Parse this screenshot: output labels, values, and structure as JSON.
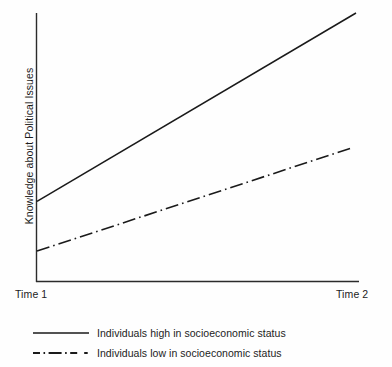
{
  "chart_data": {
    "type": "line",
    "title": "",
    "subtitle": "",
    "xlabel": "",
    "ylabel": "Knowledge about Political Issues",
    "x": [
      "Time 1",
      "Time 2"
    ],
    "categories": [
      "Time 1",
      "Time 2"
    ],
    "xticklabels": [
      "Time 1",
      "Time 2"
    ],
    "yticklabels": [],
    "xlim": [
      0,
      1
    ],
    "ylim": [
      0,
      1
    ],
    "grid": false,
    "legend_position": "below-axes-left",
    "series": [
      {
        "name": "Individuals high in socioeconomic status",
        "linestyle": "solid",
        "color": "#1a1a1a",
        "values": [
          0.3,
          1.0
        ],
        "points": [
          {
            "x": "Time 1",
            "y": 0.3
          },
          {
            "x": "Time 2",
            "y": 1.0
          }
        ]
      },
      {
        "name": "Individuals low in socioeconomic status",
        "linestyle": "dash-dot",
        "color": "#1a1a1a",
        "values": [
          0.115,
          0.5
        ],
        "points": [
          {
            "x": "Time 1",
            "y": 0.115
          },
          {
            "x": "Time 2",
            "y": 0.5
          }
        ]
      }
    ],
    "annotations": []
  },
  "axes": {
    "y_axis_label": "Knowledge about Political Issues",
    "x_tick_left": "Time 1",
    "x_tick_right": "Time 2",
    "axis_color": "#2b2b2b"
  },
  "legend": {
    "items": [
      {
        "label": "Individuals high in socioeconomic status",
        "style": "solid",
        "swatch_name": "legend-swatch-solid"
      },
      {
        "label": "Individuals low in socioeconomic status",
        "style": "dash-dot",
        "swatch_name": "legend-swatch-dashdot"
      }
    ]
  },
  "colors": {
    "background": "#fefefe",
    "ink": "#1a1a1a",
    "axis": "#2b2b2b"
  }
}
